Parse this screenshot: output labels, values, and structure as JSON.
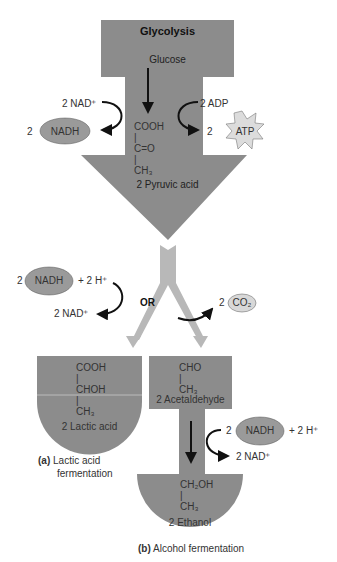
{
  "title": "Glycolysis",
  "glycolysis": {
    "substrate": "Glucose",
    "left_input": "2 NAD⁺",
    "left_output_coef": "2",
    "left_output": "NADH",
    "right_input": "2 ADP",
    "right_output_coef": "2",
    "right_output": "ATP",
    "structure": [
      "COOH",
      "|",
      "C=O",
      "|",
      "CH₃"
    ],
    "product": "2 Pyruvic acid"
  },
  "branch_label": "OR",
  "lactic": {
    "nadh_coef": "2",
    "nadh": "NADH",
    "plus_h": "+ 2 H⁺",
    "nad_out": "2 NAD⁺",
    "structure": [
      "COOH",
      "|",
      "CHOH",
      "|",
      "CH₃"
    ],
    "product": "2 Lactic acid",
    "caption_letter": "(a)",
    "caption_line1": "Lactic acid",
    "caption_line2": "fermentation"
  },
  "alcohol": {
    "co2_coef": "2",
    "co2": "CO₂",
    "intermediate_structure": [
      "CHO",
      "|",
      "CH₃"
    ],
    "intermediate": "2 Acetaldehyde",
    "nadh_coef": "2",
    "nadh": "NADH",
    "plus_h": "+ 2 H⁺",
    "nad_out": "2 NAD⁺",
    "structure": [
      "CH₂OH",
      "|",
      "CH₃"
    ],
    "product": "2 Ethanol",
    "caption_letter": "(b)",
    "caption_text": "Alcohol fermentation"
  },
  "colors": {
    "shape": "#8c8c8c",
    "light": "#b3b3b3",
    "ellipse": "#9a9a9a",
    "star": "#dcdcdc"
  }
}
